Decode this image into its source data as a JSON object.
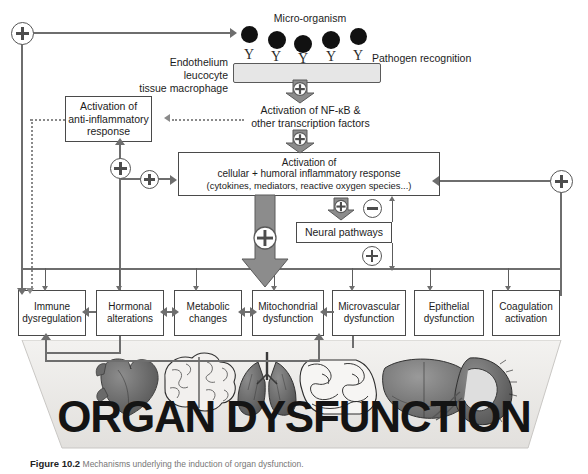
{
  "figure": {
    "caption_label": "Figure 10.2",
    "caption_text": "Mechanisms underlying the induction of organ dysfunction."
  },
  "top": {
    "micro_organism_label": "Micro-organism",
    "pathogen_recognition_label": "Pathogen recognition",
    "cell_label": "Endothelium\nleucocyte\ntissue macrophage",
    "germ_count": 5,
    "receptor_count": 5,
    "receptor_glyph": "Y"
  },
  "nodes": {
    "nfkb": "Activation of NF-κB &\nother transcription factors",
    "anti_inflammatory": "Activation of\nanti-inflammatory\nresponse",
    "inflammatory_line1": "Activation of",
    "inflammatory_line2": "cellular + humoral inflammatory response",
    "inflammatory_line3": "(cytokines, mediators, reactive oxygen species...)",
    "neural_pathways": "Neural pathways"
  },
  "organ_boxes": [
    {
      "label": "Immune\ndysregulation"
    },
    {
      "label": "Hormonal\nalterations"
    },
    {
      "label": "Metabolic\nchanges"
    },
    {
      "label": "Mitochondrial\ndysfunction"
    },
    {
      "label": "Microvascular\ndysfunction"
    },
    {
      "label": "Epithelial\ndysfunction"
    },
    {
      "label": "Coagulation\nactivation"
    }
  ],
  "banner": {
    "text": "ORGAN DYSFUNCTION",
    "organs": [
      "heart",
      "brain",
      "lungs",
      "intestines",
      "liver",
      "kidney"
    ]
  },
  "signs": {
    "plus": "+",
    "minus": "−",
    "plus_count": 10,
    "minus_count": 1
  },
  "colors": {
    "line": "#6e6e6e",
    "box_border": "#4a4a4a",
    "text": "#1c1c1c",
    "cell_fill": "#e6e6e6",
    "arrow_fill": "#8c8c8c",
    "germ": "#111111",
    "panel_bg": "#eceae7"
  }
}
